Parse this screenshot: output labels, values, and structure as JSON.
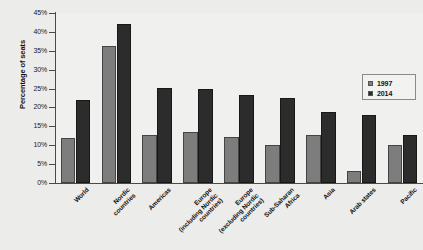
{
  "chart_data": {
    "type": "bar",
    "title": "",
    "xlabel": "",
    "ylabel": "Percentage of seats",
    "ylim": [
      0,
      45
    ],
    "ytick_step": 5,
    "grid": false,
    "legend_position": "top-right",
    "categories": [
      "World",
      "Nordic\ncountries",
      "Americas",
      "Europe\n(including Nordic\ncountries)",
      "Europe\n(excluding Nordic\ncountries)",
      "Sub-Saharan\nAfrica",
      "Asia",
      "Arab states",
      "Pacific"
    ],
    "ytick_labels": [
      "0%",
      "5%",
      "10%",
      "15%",
      "20%",
      "25%",
      "30%",
      "35%",
      "40%",
      "45%"
    ],
    "series": [
      {
        "name": "1997",
        "color": "#7d7d7d",
        "values": [
          11.8,
          36.4,
          12.6,
          13.6,
          12.1,
          10.1,
          12.6,
          3.2,
          10.0
        ]
      },
      {
        "name": "2014",
        "color": "#2c2c2c",
        "values": [
          22.1,
          42.1,
          25.2,
          25.0,
          23.4,
          22.5,
          18.9,
          18.0,
          12.6
        ]
      }
    ]
  }
}
